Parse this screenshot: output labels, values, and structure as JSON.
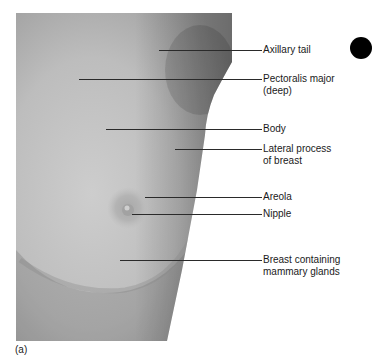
{
  "figure": {
    "caption": "(a)",
    "colors": {
      "skin_light": "#c9c9c9",
      "skin_mid": "#b3b3b3",
      "skin_shadow": "#8f8f8f",
      "leader": "#2a2a2a",
      "tab_marker": "#000000"
    },
    "labels": [
      {
        "id": "axillary-tail",
        "lines": [
          "Axillary tail"
        ],
        "line_y": 50,
        "line_x1": 159
      },
      {
        "id": "pectoralis-major",
        "lines": [
          "Pectoralis major",
          "(deep)"
        ],
        "line_y": 79,
        "line_x1": 79
      },
      {
        "id": "body",
        "lines": [
          "Body"
        ],
        "line_y": 129,
        "line_x1": 106
      },
      {
        "id": "lateral-process",
        "lines": [
          "Lateral process",
          "of breast"
        ],
        "line_y": 149,
        "line_x1": 175
      },
      {
        "id": "areola",
        "lines": [
          "Areola"
        ],
        "line_y": 197,
        "line_x1": 145
      },
      {
        "id": "nipple",
        "lines": [
          "Nipple"
        ],
        "line_y": 214,
        "line_x1": 132
      },
      {
        "id": "breast-glands",
        "lines": [
          "Breast containing",
          "mammary glands"
        ],
        "line_y": 260,
        "line_x1": 120
      }
    ]
  }
}
